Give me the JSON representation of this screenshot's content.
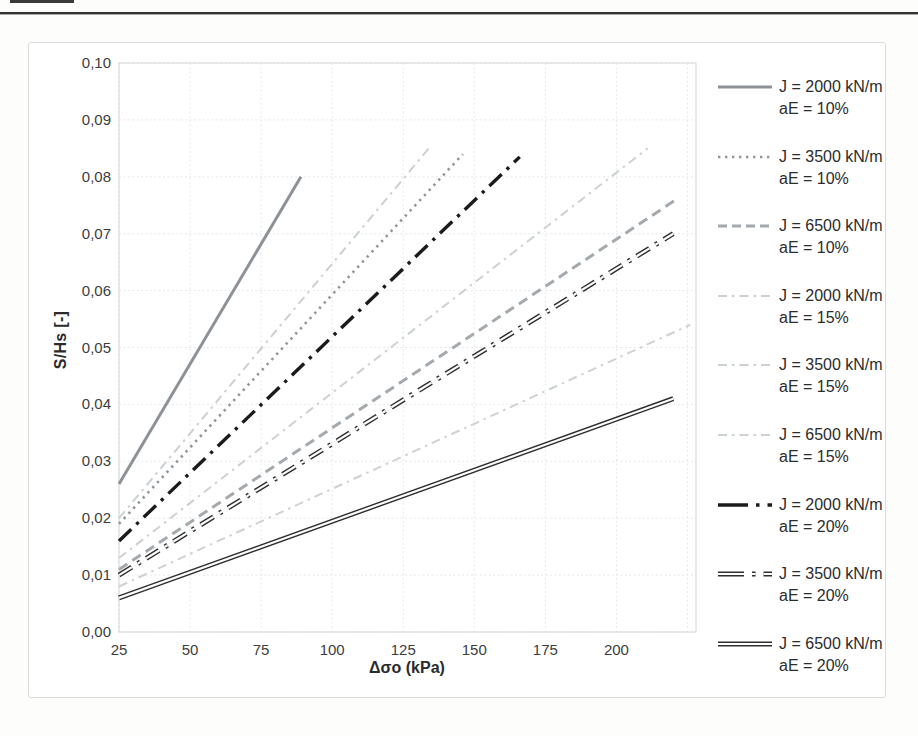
{
  "chart_data": {
    "type": "line",
    "title": "",
    "xlabel": "Δσo (kPa)",
    "ylabel": "S/Hs [-]",
    "xlim": [
      25,
      228
    ],
    "ylim": [
      0,
      0.1
    ],
    "grid": true,
    "legend_position": "right",
    "x_ticks": [
      25,
      50,
      75,
      100,
      125,
      150,
      175,
      200
    ],
    "x_tick_labels": [
      "25",
      "50",
      "75",
      "100",
      "125",
      "150",
      "175",
      "200"
    ],
    "y_ticks": [
      0.0,
      0.01,
      0.02,
      0.03,
      0.04,
      0.05,
      0.06,
      0.07,
      0.08,
      0.09,
      0.1
    ],
    "y_tick_labels": [
      "0,00",
      "0,01",
      "0,02",
      "0,03",
      "0,04",
      "0,05",
      "0,06",
      "0,07",
      "0,08",
      "0,09",
      "0,10"
    ],
    "series": [
      {
        "id": "J2000-aE10",
        "label_j": "J = 2000 kN/m",
        "label_ae": "aE = 10%",
        "x": [
          25,
          89
        ],
        "y": [
          0.026,
          0.08
        ],
        "style": "solid",
        "color": "#8d9296",
        "width": 3
      },
      {
        "id": "J3500-aE10",
        "label_j": "J = 3500 kN/m",
        "label_ae": "aE = 10%",
        "x": [
          25,
          146
        ],
        "y": [
          0.019,
          0.084
        ],
        "style": "dotted",
        "color": "#91969b",
        "width": 2.6
      },
      {
        "id": "J6500-aE10",
        "label_j": "J = 6500 kN/m",
        "label_ae": "aE = 10%",
        "x": [
          25,
          221
        ],
        "y": [
          0.011,
          0.076
        ],
        "style": "dashed",
        "color": "#a4a9ad",
        "width": 3
      },
      {
        "id": "J2000-aE15",
        "label_j": "J = 2000 kN/m",
        "label_ae": "aE = 15%",
        "x": [
          25,
          134
        ],
        "y": [
          0.02,
          0.085
        ],
        "style": "dashdot",
        "color": "#cbd0d3",
        "width": 2
      },
      {
        "id": "J3500-aE15",
        "label_j": "J = 3500 kN/m",
        "label_ae": "aE = 15%",
        "x": [
          25,
          211
        ],
        "y": [
          0.013,
          0.085
        ],
        "style": "dashdot",
        "color": "#ccd1d4",
        "width": 2
      },
      {
        "id": "J6500-aE15",
        "label_j": "J = 6500 kN/m",
        "label_ae": "aE = 15%",
        "x": [
          25,
          226
        ],
        "y": [
          0.008,
          0.054
        ],
        "style": "dashdot",
        "color": "#cdd2d5",
        "width": 2
      },
      {
        "id": "J2000-aE20",
        "label_j": "J = 2000 kN/m",
        "label_ae": "aE = 20%",
        "x": [
          25,
          166
        ],
        "y": [
          0.016,
          0.0835
        ],
        "style": "longdashdot",
        "color": "#1b1b1b",
        "width": 3.4
      },
      {
        "id": "J3500-aE20",
        "label_j": "J = 3500 kN/m",
        "label_ae": "aE = 20%",
        "x": [
          25,
          220
        ],
        "y": [
          0.01,
          0.07
        ],
        "style": "longdashdot-outline",
        "color": "#2e2e2e",
        "width": 5
      },
      {
        "id": "J6500-aE20",
        "label_j": "J = 6500 kN/m",
        "label_ae": "aE = 20%",
        "x": [
          25,
          220
        ],
        "y": [
          0.006,
          0.041
        ],
        "style": "solid-outline",
        "color": "#2e2e2e",
        "width": 5
      }
    ]
  }
}
